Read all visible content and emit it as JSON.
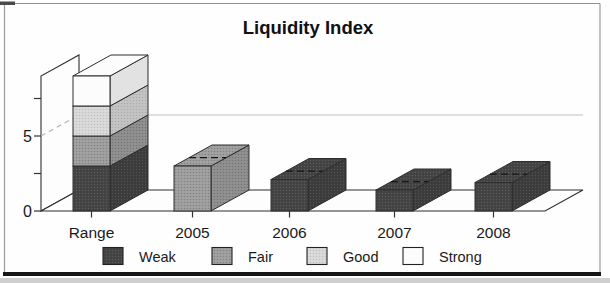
{
  "figure": {
    "frame_color": "#8f8f8f",
    "bottom_rule_color": "#161616",
    "scan_strip_color": "#cfcfcf",
    "paper_color": "#fdfdfd"
  },
  "chart_data": {
    "type": "bar",
    "variant": "3d-stacked-bar",
    "title": "Liquidity Index",
    "categories": [
      "Range",
      "2005",
      "2006",
      "2007",
      "2008"
    ],
    "ylim": [
      0,
      9
    ],
    "ytick_interval": 2.5,
    "ytick_labels_shown": [
      {
        "value": 0,
        "label": "0"
      },
      {
        "value": 5,
        "label": "5"
      }
    ],
    "gridline_at": 5,
    "legend_position": "bottom",
    "legend": [
      {
        "label": "Weak",
        "color": "#424242"
      },
      {
        "label": "Fair",
        "color": "#a2a2a2"
      },
      {
        "label": "Good",
        "color": "#dbdbdb"
      },
      {
        "label": "Strong",
        "color": "#fcfcfc"
      }
    ],
    "bars": [
      {
        "category": "Range",
        "segments": [
          {
            "name": "Weak",
            "value": 3
          },
          {
            "name": "Fair",
            "value": 2
          },
          {
            "name": "Good",
            "value": 2
          },
          {
            "name": "Strong",
            "value": 2
          }
        ]
      },
      {
        "category": "2005",
        "segments": [
          {
            "name": "Fair",
            "value": 3
          }
        ]
      },
      {
        "category": "2006",
        "segments": [
          {
            "name": "Weak",
            "value": 2.1
          }
        ]
      },
      {
        "category": "2007",
        "segments": [
          {
            "name": "Weak",
            "value": 1.4
          }
        ]
      },
      {
        "category": "2008",
        "segments": [
          {
            "name": "Weak",
            "value": 1.9
          }
        ]
      }
    ]
  }
}
